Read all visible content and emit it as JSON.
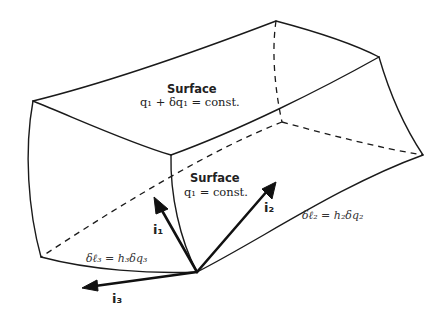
{
  "diagram": {
    "type": "curvilinear-volume-element",
    "surfaces": [
      {
        "title": "Surface",
        "equation_var": "q",
        "equation": "q₁+δq₁=const."
      },
      {
        "title": "Surface",
        "equation": "q₁=const."
      }
    ],
    "labels": {
      "surface_top_title": "Surface",
      "surface_top_eq": "q₁ + δq₁ = const.",
      "surface_front_title": "Surface",
      "surface_front_eq": "q₁ = const.",
      "arc_length_2": "δℓ₂ = h₂δq₂",
      "arc_length_3": "δℓ₃ = h₃δq₃"
    },
    "vectors": [
      {
        "name": "i",
        "sub": "1",
        "label": "i₁"
      },
      {
        "name": "i",
        "sub": "2",
        "label": "i₂"
      },
      {
        "name": "i",
        "sub": "3",
        "label": "i₃"
      }
    ],
    "colors": {
      "line": "#1a1a1a",
      "background": "#ffffff"
    }
  }
}
